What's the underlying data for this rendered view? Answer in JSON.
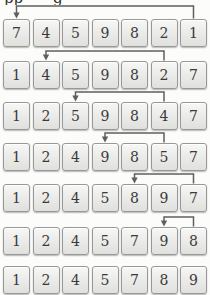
{
  "title": {
    "fragments": [
      {
        "text": "pp",
        "x": 4
      },
      {
        "text": "g",
        "x": 53
      }
    ]
  },
  "diagram": {
    "rows": [
      {
        "cells": [
          7,
          4,
          5,
          9,
          8,
          2,
          1
        ]
      },
      {
        "cells": [
          1,
          4,
          5,
          9,
          8,
          2,
          7
        ]
      },
      {
        "cells": [
          1,
          2,
          5,
          9,
          8,
          4,
          7
        ]
      },
      {
        "cells": [
          1,
          2,
          4,
          9,
          8,
          5,
          7
        ]
      },
      {
        "cells": [
          1,
          2,
          4,
          5,
          8,
          9,
          7
        ]
      },
      {
        "cells": [
          1,
          2,
          4,
          5,
          7,
          9,
          8
        ]
      },
      {
        "cells": [
          1,
          2,
          4,
          5,
          7,
          8,
          9
        ]
      }
    ],
    "swap_arrows": [
      {
        "above_row": 0,
        "from_col": 6,
        "to_col": 0
      },
      {
        "above_row": 1,
        "from_col": 5,
        "to_col": 1
      },
      {
        "above_row": 2,
        "from_col": 5,
        "to_col": 2
      },
      {
        "above_row": 3,
        "from_col": 5,
        "to_col": 3
      },
      {
        "above_row": 4,
        "from_col": 6,
        "to_col": 4
      },
      {
        "above_row": 5,
        "from_col": 6,
        "to_col": 5
      }
    ]
  },
  "colors": {
    "background": "#fcfcfa",
    "cell_border": "#98989a",
    "cell_fill_top": "#f7f7f5",
    "cell_fill_bottom": "#e0e0dd",
    "digit": "#3a3a3a",
    "arrow": "#5f5f5f"
  }
}
